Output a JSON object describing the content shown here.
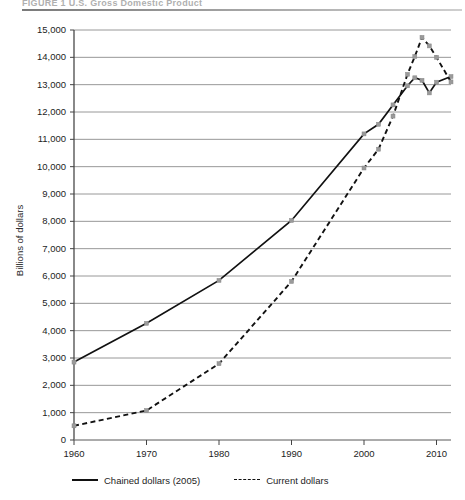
{
  "figure": {
    "title": "FIGURE 1  U.S. Gross Domestic Product",
    "ylabel": "Billions of dollars"
  },
  "legend": {
    "items": [
      {
        "label": "Chained dollars (2005)",
        "style": "solid",
        "color": "#111111"
      },
      {
        "label": "Current dollars",
        "style": "dashed",
        "color": "#111111"
      }
    ]
  },
  "axes": {
    "y_ticks": [
      "15,000",
      "14,000",
      "13,000",
      "12,000",
      "11,000",
      "10,000",
      "9,000",
      "8,000",
      "7,000",
      "6,000",
      "5,000",
      "4,000",
      "3,000",
      "2,000",
      "1,000",
      "0"
    ],
    "x_ticks": [
      "1960",
      "1970",
      "1980",
      "1990",
      "2000",
      "2010"
    ]
  },
  "chart_data": {
    "type": "line",
    "title": "FIGURE 1  U.S. Gross Domestic Product",
    "xlabel": "",
    "ylabel": "Billions of dollars",
    "xlim": [
      1960,
      2012
    ],
    "ylim": [
      0,
      15000
    ],
    "ytick_step": 1000,
    "xtick_step": 10,
    "grid": "horizontal",
    "legend_position": "below-axis",
    "x": [
      1960,
      1970,
      1980,
      1990,
      2000,
      2002,
      2004,
      2006,
      2007,
      2008,
      2009,
      2010,
      2012
    ],
    "series": [
      {
        "name": "Chained dollars (2005)",
        "style": "solid",
        "color": "#111111",
        "values": [
          2850,
          4270,
          5840,
          8030,
          11200,
          11550,
          12260,
          12960,
          13250,
          13160,
          12700,
          13090,
          13300
        ]
      },
      {
        "name": "Current dollars",
        "style": "dashed",
        "color": "#111111",
        "values": [
          520,
          1080,
          2790,
          5800,
          9950,
          10640,
          11850,
          13380,
          14030,
          14730,
          14420,
          14000,
          13100
        ]
      }
    ]
  }
}
